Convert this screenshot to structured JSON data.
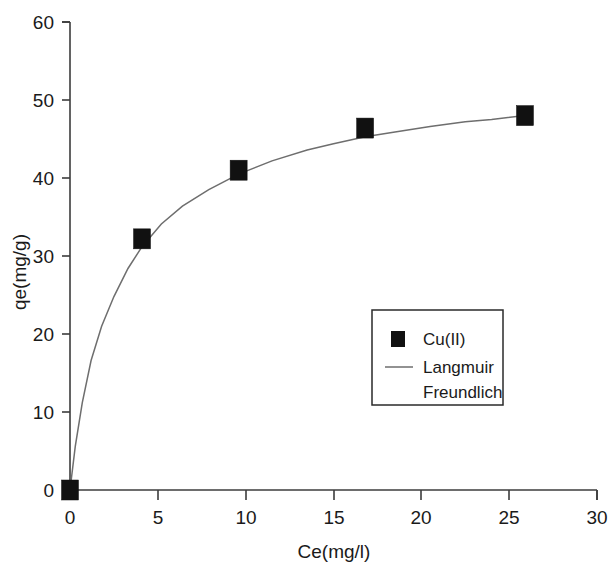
{
  "chart_data": {
    "type": "scatter",
    "title": "",
    "subtitle": "",
    "xlabel": "Ce(mg/l)",
    "ylabel": "qe(mg/g)",
    "xlim": [
      0,
      30
    ],
    "ylim": [
      0,
      60
    ],
    "xticks": [
      0,
      5,
      10,
      15,
      20,
      25,
      30
    ],
    "yticks": [
      0,
      10,
      20,
      30,
      40,
      50,
      60
    ],
    "xtick_labels": [
      "0",
      "5",
      "10",
      "15",
      "20",
      "25",
      "30"
    ],
    "ytick_labels": [
      "0",
      "10",
      "20",
      "30",
      "40",
      "50",
      "60"
    ],
    "grid": false,
    "legend_position": "center-right",
    "series": [
      {
        "name": "Cu(II)",
        "type": "scatter",
        "marker": "square",
        "color": "#111111",
        "x": [
          0.0,
          4.1,
          9.6,
          16.8,
          25.9
        ],
        "y": [
          0.0,
          32.2,
          41.0,
          46.4,
          48.0
        ]
      },
      {
        "name": "Langmuir",
        "type": "line",
        "color": "#6e6e6e",
        "x": [
          0.0,
          0.3,
          0.7,
          1.2,
          1.8,
          2.5,
          3.3,
          4.1,
          5.2,
          6.4,
          7.9,
          9.6,
          11.5,
          13.5,
          15.0,
          16.8,
          18.5,
          20.5,
          22.5,
          24.0,
          25.9
        ],
        "y": [
          0.0,
          5.6,
          11.2,
          16.6,
          21.0,
          24.8,
          28.4,
          31.2,
          34.1,
          36.4,
          38.5,
          40.5,
          42.2,
          43.6,
          44.4,
          45.3,
          45.9,
          46.6,
          47.2,
          47.5,
          48.0
        ]
      },
      {
        "name": "Freundlich",
        "type": "line",
        "color": "#6e6e6e",
        "x": [],
        "y": []
      }
    ]
  },
  "legend": {
    "entries": [
      {
        "label": "Cu(II)",
        "symbol": "square-marker"
      },
      {
        "label": "Langmuir",
        "symbol": "line-swatch"
      },
      {
        "label": "Freundlich",
        "symbol": "none"
      }
    ]
  },
  "axes": {
    "x_title": "Ce(mg/l)",
    "y_title": "qe(mg/g)"
  }
}
